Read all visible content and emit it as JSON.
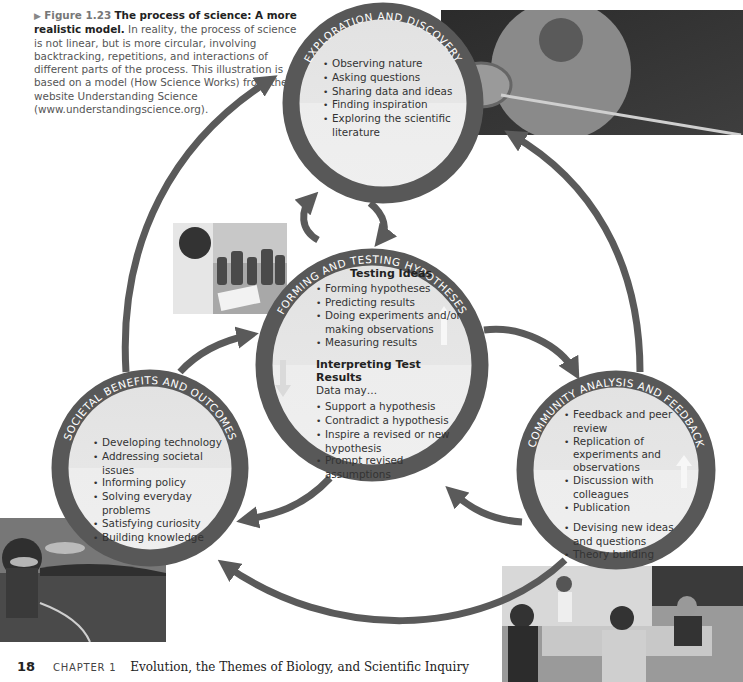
{
  "caption": {
    "marker": "▶",
    "figure_label": "Figure 1.23",
    "title": "The process of science: A more realistic model.",
    "body": "In reality, the process of science is not linear, but is more circular, involving backtracking, repetitions, and interactions of different parts of the process. This illustration is based on a model (How Science Works) from the website Understanding Science (www.understandingscience.org)."
  },
  "colors": {
    "ring": "#585858",
    "arrow": "#5a5a5a",
    "disk_top": "#e4e4e4",
    "disk_bottom": "#eeeeee",
    "ring_text": "#ffffff"
  },
  "circles": {
    "exploration": {
      "title": "EXPLORATION AND DISCOVERY",
      "items": [
        "Observing nature",
        "Asking questions",
        "Sharing data and ideas",
        "Finding inspiration",
        "Exploring the scientific literature"
      ]
    },
    "testing": {
      "title": "FORMING AND TESTING HYPOTHESES",
      "section1_heading": "Testing Ideas",
      "section1_items": [
        "Forming hypotheses",
        "Predicting results",
        "Doing experiments and/or making observations",
        "Measuring results"
      ],
      "section2_heading": "Interpreting Test Results",
      "section2_intro": "Data may…",
      "section2_items": [
        "Support a hypothesis",
        "Contradict a hypothesis",
        "Inspire a revised or new hypothesis",
        "Prompt revised assumptions"
      ]
    },
    "societal": {
      "title": "SOCIETAL BENEFITS AND OUTCOMES",
      "items": [
        "Developing technology",
        "Addressing societal issues",
        "Informing policy",
        "Solving everyday problems",
        "Satisfying curiosity",
        "Building knowledge"
      ]
    },
    "community": {
      "title": "COMMUNITY ANALYSIS AND FEEDBACK",
      "items_top": [
        "Feedback and peer review",
        "Replication of experiments and observations",
        "Discussion with colleagues",
        "Publication"
      ],
      "items_bottom": [
        "Devising new ideas and questions",
        "Theory building"
      ]
    }
  },
  "photos": {
    "exploration": "student with sampling net outdoors",
    "testing": "researcher taking notes beside specimen jars",
    "societal": "person in canoe on a lake",
    "community": "group discussion around a meeting table"
  },
  "footer": {
    "page_number": "18",
    "chapter_label": "CHAPTER 1",
    "chapter_title": "Evolution, the Themes of Biology, and Scientific Inquiry"
  }
}
